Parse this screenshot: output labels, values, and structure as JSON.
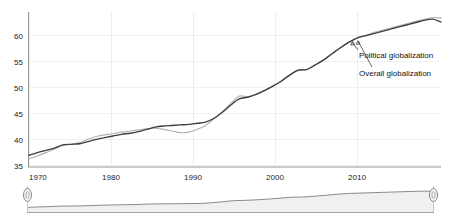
{
  "chart_data": {
    "type": "line",
    "title": "",
    "subtitle": "",
    "xlabel": "",
    "ylabel": "",
    "xlim": [
      1970,
      2019
    ],
    "ylim": [
      35,
      63
    ],
    "grid": true,
    "legend_position": "inline-annotation",
    "yticks": [
      35,
      40,
      45,
      50,
      55,
      60
    ],
    "xticks": [
      1970,
      1980,
      1990,
      2000,
      2010
    ],
    "x": [
      1970,
      1971,
      1972,
      1973,
      1974,
      1975,
      1976,
      1977,
      1978,
      1979,
      1980,
      1981,
      1982,
      1983,
      1984,
      1985,
      1986,
      1987,
      1988,
      1989,
      1990,
      1991,
      1992,
      1993,
      1994,
      1995,
      1996,
      1997,
      1998,
      1999,
      2000,
      2001,
      2002,
      2003,
      2004,
      2005,
      2006,
      2007,
      2008,
      2009,
      2010,
      2011,
      2012,
      2013,
      2014,
      2015,
      2016,
      2017,
      2018,
      2019
    ],
    "series": [
      {
        "name": "Overall globalization",
        "color": "#3e3e3e",
        "values": [
          37.1,
          37.6,
          38.0,
          38.4,
          39.0,
          39.1,
          39.2,
          39.6,
          40.0,
          40.3,
          40.6,
          40.9,
          41.1,
          41.4,
          41.8,
          42.2,
          42.4,
          42.5,
          42.6,
          42.7,
          42.9,
          43.1,
          43.8,
          44.9,
          46.2,
          47.3,
          47.6,
          48.1,
          48.8,
          49.6,
          50.5,
          51.6,
          52.5,
          52.6,
          53.4,
          54.3,
          55.4,
          56.5,
          57.5,
          58.3,
          58.7,
          59.1,
          59.5,
          59.9,
          60.3,
          60.7,
          61.1,
          61.5,
          61.7,
          61.2
        ]
      },
      {
        "name": "Political globalization",
        "color": "#b2b2b2",
        "values": [
          36.5,
          37.0,
          37.6,
          38.2,
          38.9,
          39.1,
          39.4,
          40.0,
          40.5,
          40.8,
          41.0,
          41.3,
          41.5,
          41.7,
          41.9,
          42.0,
          41.8,
          41.5,
          41.2,
          41.3,
          41.8,
          42.5,
          43.7,
          45.0,
          46.5,
          47.8,
          47.7,
          48.1,
          48.8,
          49.6,
          50.5,
          51.6,
          52.4,
          52.6,
          53.4,
          54.3,
          55.4,
          56.5,
          57.5,
          58.3,
          58.8,
          59.3,
          59.7,
          60.1,
          60.5,
          60.9,
          61.3,
          61.7,
          62.0,
          61.9
        ]
      }
    ],
    "annotations": [
      {
        "label": "Political globalization",
        "points_to_series": "Political globalization"
      },
      {
        "label": "Overall globalization",
        "points_to_series": "Overall globalization"
      }
    ]
  },
  "axis": {
    "y_tick_labels": [
      "60",
      "55",
      "50",
      "45",
      "40",
      "35"
    ],
    "x_tick_labels": [
      "1970",
      "1980",
      "1990",
      "2000",
      "2010"
    ]
  },
  "annotations": {
    "political": "Political globalization",
    "overall": "Overall globalization"
  },
  "navigator": {
    "left_handle": "range-start-handle",
    "right_handle": "range-end-handle"
  },
  "colors": {
    "overall_line": "#3e3e3e",
    "political_line": "#b2b2b2",
    "grid": "#e9e9ef",
    "axis": "#8a8a8a",
    "navigator_fill": "#f0f0ee"
  }
}
